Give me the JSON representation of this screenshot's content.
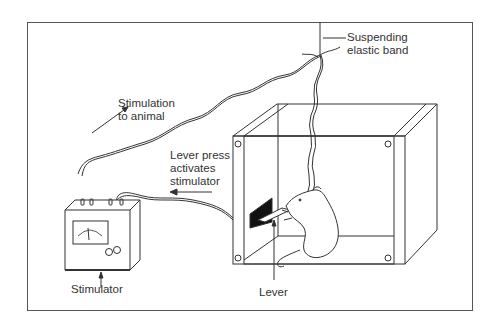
{
  "diagram": {
    "type": "apparatus-illustration",
    "labels": {
      "suspending_band_line1": "Suspending",
      "suspending_band_line2": "elastic band",
      "stimulation_line1": "Stimulation",
      "stimulation_line2": "to animal",
      "lever_press_line1": "Lever press",
      "lever_press_line2": "activates",
      "lever_press_line3": "stimulator",
      "stimulator": "Stimulator",
      "lever": "Lever"
    },
    "components": [
      "stimulator",
      "wires",
      "skinner-box",
      "rat",
      "lever",
      "suspending-elastic-band"
    ],
    "colors": {
      "line": "#333333",
      "background": "#ffffff",
      "lever_panel": "#111111"
    }
  }
}
